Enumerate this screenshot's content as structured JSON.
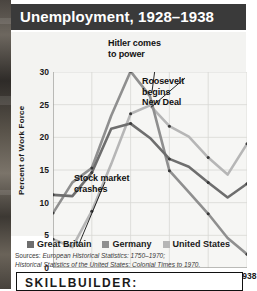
{
  "title": "Unemployment, 1928–1938",
  "legend": [
    {
      "label": "Great Britain",
      "color": "#6e6e6e"
    },
    {
      "label": "Germany",
      "color": "#8f8f8f"
    },
    {
      "label": "United States",
      "color": "#b6b6b6"
    }
  ],
  "annotations": {
    "hitler": "Hitler comes\nto power",
    "roosevelt": "Roosevelt\nbegins\nNew Deal",
    "stock": "Stock market\ncrashes"
  },
  "sources": {
    "prefix": "Sources: ",
    "line1": "European Historical Statistics: 1750–1970;",
    "line2": "Historical Statistics of the United States: Colonial Times to 1970."
  },
  "skillbuilder": {
    "label": "SKILLBUILDER:"
  },
  "chart_data": {
    "type": "line",
    "title": "Unemployment, 1928–1938",
    "xlabel": "",
    "ylabel": "Percent of Work Force",
    "xlim": [
      1928,
      1938
    ],
    "ylim": [
      0,
      30
    ],
    "yticks": [
      0,
      5,
      10,
      15,
      20,
      25,
      30
    ],
    "xticks": [
      1928,
      1930,
      1932,
      1934,
      1936,
      1938
    ],
    "x": [
      1928,
      1929,
      1930,
      1931,
      1932,
      1933,
      1934,
      1935,
      1936,
      1937,
      1938
    ],
    "grid": true,
    "legend_position": "bottom",
    "series": [
      {
        "name": "Great Britain",
        "color": "#6e6e6e",
        "values": [
          11.2,
          11.0,
          14.6,
          21.3,
          22.1,
          19.9,
          16.7,
          15.5,
          13.1,
          10.8,
          12.9
        ]
      },
      {
        "name": "Germany",
        "color": "#8f8f8f",
        "values": [
          8.4,
          13.1,
          15.3,
          23.3,
          30.1,
          26.3,
          14.9,
          11.6,
          8.3,
          4.6,
          2.1
        ]
      },
      {
        "name": "United States",
        "color": "#b6b6b6",
        "values": [
          4.4,
          3.2,
          8.7,
          15.9,
          23.6,
          24.9,
          21.7,
          20.1,
          16.9,
          14.3,
          19.0
        ]
      }
    ],
    "annotations": [
      {
        "text": "Hitler comes to power",
        "points_to_year": 1933,
        "series": "Germany"
      },
      {
        "text": "Roosevelt begins New Deal",
        "points_to_year": 1933,
        "series": "United States"
      },
      {
        "text": "Stock market crashes",
        "points_to_year": 1929,
        "series": "United States"
      }
    ]
  }
}
